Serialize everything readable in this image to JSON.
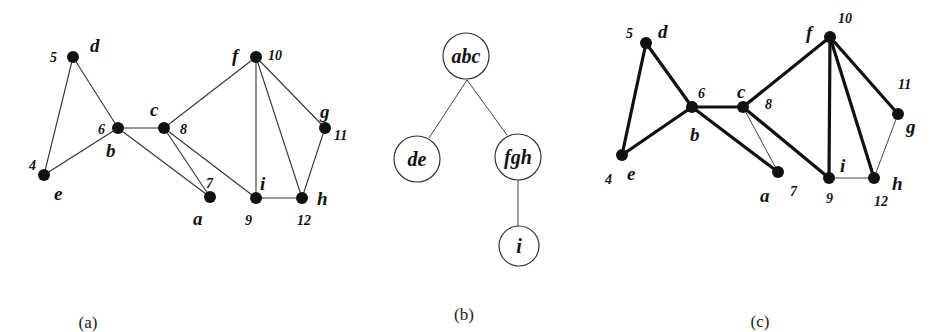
{
  "figures": [
    {
      "id": "a",
      "caption": "(a)",
      "nodes": [
        {
          "letter": "d",
          "number": "5"
        },
        {
          "letter": "e",
          "number": "4"
        },
        {
          "letter": "b",
          "number": "6"
        },
        {
          "letter": "c",
          "number": "8"
        },
        {
          "letter": "a",
          "number": "7"
        },
        {
          "letter": "f",
          "number": "10"
        },
        {
          "letter": "g",
          "number": "11"
        },
        {
          "letter": "i",
          "number": "9"
        },
        {
          "letter": "h",
          "number": "12"
        }
      ],
      "edges": [
        [
          "d",
          "e"
        ],
        [
          "d",
          "b"
        ],
        [
          "e",
          "b"
        ],
        [
          "b",
          "c"
        ],
        [
          "b",
          "a"
        ],
        [
          "c",
          "a"
        ],
        [
          "c",
          "f"
        ],
        [
          "c",
          "i"
        ],
        [
          "f",
          "i"
        ],
        [
          "f",
          "h"
        ],
        [
          "f",
          "g"
        ],
        [
          "g",
          "h"
        ],
        [
          "i",
          "h"
        ]
      ]
    },
    {
      "id": "b",
      "caption": "(b)",
      "tree_nodes": [
        "abc",
        "de",
        "fgh",
        "i"
      ],
      "tree_edges": [
        [
          "abc",
          "de"
        ],
        [
          "abc",
          "fgh"
        ],
        [
          "fgh",
          "i"
        ]
      ]
    },
    {
      "id": "c",
      "caption": "(c)",
      "nodes": [
        {
          "letter": "d",
          "number": "5"
        },
        {
          "letter": "e",
          "number": "4"
        },
        {
          "letter": "b",
          "number": "6"
        },
        {
          "letter": "c",
          "number": "8"
        },
        {
          "letter": "a",
          "number": "7"
        },
        {
          "letter": "f",
          "number": "10"
        },
        {
          "letter": "g",
          "number": "11"
        },
        {
          "letter": "i",
          "number": "9"
        },
        {
          "letter": "h",
          "number": "12"
        }
      ],
      "bold_edges": [
        [
          "d",
          "e"
        ],
        [
          "d",
          "b"
        ],
        [
          "e",
          "b"
        ],
        [
          "b",
          "c"
        ],
        [
          "b",
          "a"
        ],
        [
          "c",
          "f"
        ],
        [
          "c",
          "i"
        ],
        [
          "f",
          "i"
        ],
        [
          "f",
          "h"
        ],
        [
          "f",
          "g"
        ]
      ],
      "thin_edges": [
        [
          "c",
          "a"
        ],
        [
          "g",
          "h"
        ],
        [
          "i",
          "h"
        ]
      ]
    }
  ]
}
